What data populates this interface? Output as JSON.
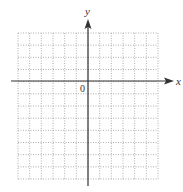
{
  "figure": {
    "type": "coordinate-grid",
    "axes": {
      "x_label": "x",
      "y_label": "y",
      "origin_label": "0"
    },
    "grid": {
      "columns": 12,
      "rows": 12,
      "cells_left_of_y_axis": 6,
      "cells_right_of_y_axis": 6,
      "cells_above_x_axis": 4,
      "cells_below_x_axis": 8,
      "line_style": "dotted"
    },
    "colors": {
      "grid": "#9a9a9a",
      "axis": "#333333",
      "background": "#ffffff"
    }
  }
}
